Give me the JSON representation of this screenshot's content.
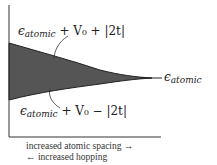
{
  "diagram": {
    "labels": {
      "upper": {
        "eps": "ϵ",
        "sub": "atomic",
        "rest": " + V₀ + |2t|"
      },
      "lower": {
        "eps": "ϵ",
        "sub": "atomic",
        "rest": " + V₀ − |2t|"
      },
      "right": {
        "eps": "ϵ",
        "sub": "atomic"
      }
    },
    "caption": {
      "line1": "increased atomic spacing →",
      "line2": "← increased hopping"
    },
    "colors": {
      "band_fill": "#555555",
      "axis": "#333333"
    }
  }
}
